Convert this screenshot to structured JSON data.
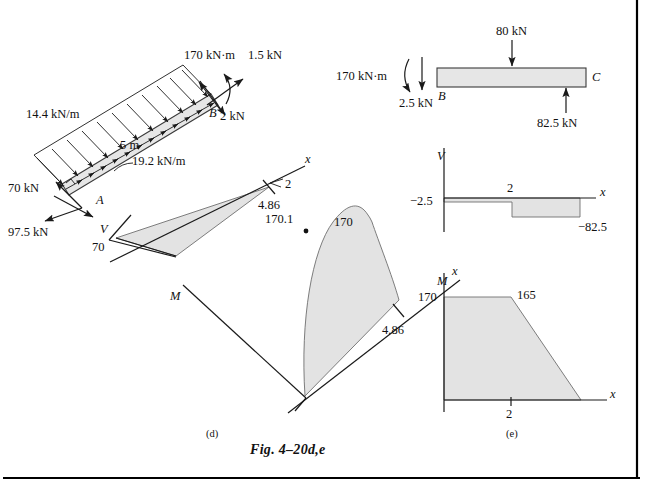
{
  "figure": {
    "caption": "Fig. 4–20d,e",
    "panel_d_id": "(d)",
    "panel_e_id": "(e)"
  },
  "panel_d": {
    "name": "inclined-beam-free-body-and-diagrams",
    "beam": {
      "point_a_label": "A",
      "point_b_label": "B",
      "length_label": "5 m",
      "distributed_normal_load": "14.4 kN/m",
      "distributed_axial_load": "19.2 kN/m"
    },
    "loads": {
      "moment_at_b": "170 kN·m",
      "axial_at_b": "1.5 kN",
      "normal_at_b": "2 kN",
      "reaction_a_normal": "70 kN",
      "reaction_a_axial": "97.5 kN"
    },
    "shear_diagram": {
      "axis_v_label": "V",
      "axis_x_label": "x",
      "start_value": "70",
      "tick_value": "2",
      "end_value": "4.86"
    },
    "moment_diagram": {
      "axis_m_label": "M",
      "axis_x_label": "x",
      "peak_value": "170.1",
      "end_value": "170",
      "x_end_value": "4.86"
    }
  },
  "panel_e": {
    "name": "horizontal-beam-free-body-and-diagrams",
    "beam": {
      "point_b_label": "B",
      "point_c_label": "C"
    },
    "loads": {
      "moment_at_b": "170 kN·m",
      "point_load_b": "2.5 kN",
      "point_load_mid": "80 kN",
      "reaction_c": "82.5 kN"
    },
    "shear_diagram": {
      "axis_v_label": "V",
      "axis_x_label": "x",
      "value_start": "−2.5",
      "tick_value": "2",
      "value_end": "−82.5"
    },
    "moment_diagram": {
      "axis_m_label": "M",
      "axis_x_label": "x",
      "value_start": "170",
      "value_break": "165",
      "tick_value": "2"
    }
  },
  "colors": {
    "ink": "#111111",
    "shade": "#e3e3e3",
    "outline": "#6f6f6f",
    "border": "#000000"
  }
}
